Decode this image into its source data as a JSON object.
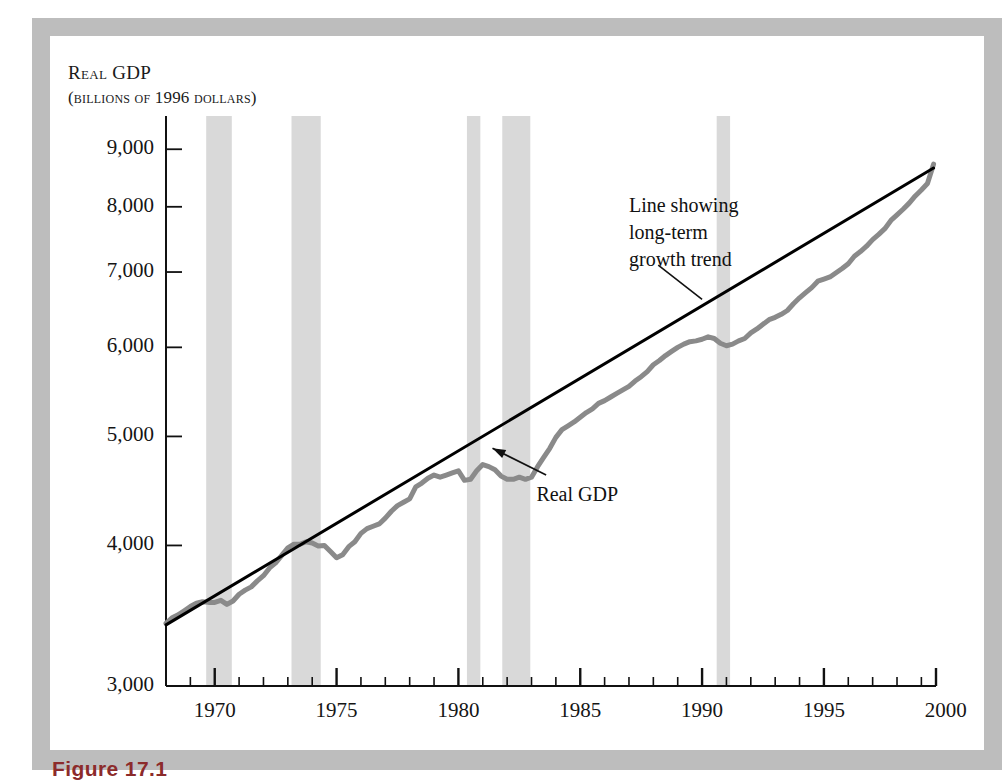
{
  "figure": {
    "caption": "Figure 17.1",
    "frame_color": "#bdbdbd",
    "background": "#ffffff"
  },
  "chart_data": {
    "type": "line",
    "title": "",
    "ylabel": "Real GDP",
    "ylabel_sub": "(billions of 1996 dollars)",
    "xlabel": "",
    "xlim": [
      1968.0,
      1999.6
    ],
    "ylim": [
      3000,
      9400
    ],
    "grid": false,
    "legend": "none",
    "y_ticks": [
      3000,
      4000,
      5000,
      6000,
      7000,
      8000,
      9000
    ],
    "y_tick_labels": [
      "3,000",
      "4,000",
      "5,000",
      "6,000",
      "7,000",
      "8,000",
      "9,000"
    ],
    "y_scale": "logarithmic",
    "x_ticks": [
      1970,
      1975,
      1980,
      1985,
      1990,
      1995,
      2000
    ],
    "x_tick_labels": [
      "1970",
      "1975",
      "1980",
      "1985",
      "1990",
      "1995",
      "2000"
    ],
    "x_minor_tick_interval": 1,
    "series": [
      {
        "name": "Real GDP",
        "color": "#8a8a8a",
        "linewidth": 5,
        "x": [
          1968.0,
          1968.25,
          1968.5,
          1968.75,
          1969.0,
          1969.25,
          1969.5,
          1969.75,
          1970.0,
          1970.25,
          1970.5,
          1970.75,
          1971.0,
          1971.25,
          1971.5,
          1971.75,
          1972.0,
          1972.25,
          1972.5,
          1972.75,
          1973.0,
          1973.25,
          1973.5,
          1973.75,
          1974.0,
          1974.25,
          1974.5,
          1974.75,
          1975.0,
          1975.25,
          1975.5,
          1975.75,
          1976.0,
          1976.25,
          1976.5,
          1976.75,
          1977.0,
          1977.25,
          1977.5,
          1977.75,
          1978.0,
          1978.25,
          1978.5,
          1978.75,
          1979.0,
          1979.25,
          1979.5,
          1979.75,
          1980.0,
          1980.25,
          1980.5,
          1980.75,
          1981.0,
          1981.25,
          1981.5,
          1981.75,
          1982.0,
          1982.25,
          1982.5,
          1982.75,
          1983.0,
          1983.25,
          1983.5,
          1983.75,
          1984.0,
          1984.25,
          1984.5,
          1984.75,
          1985.0,
          1985.25,
          1985.5,
          1985.75,
          1986.0,
          1986.25,
          1986.5,
          1986.75,
          1987.0,
          1987.25,
          1987.5,
          1987.75,
          1988.0,
          1988.25,
          1988.5,
          1988.75,
          1989.0,
          1989.25,
          1989.5,
          1989.75,
          1990.0,
          1990.25,
          1990.5,
          1990.75,
          1991.0,
          1991.25,
          1991.5,
          1991.75,
          1992.0,
          1992.25,
          1992.5,
          1992.75,
          1993.0,
          1993.25,
          1993.5,
          1993.75,
          1994.0,
          1994.25,
          1994.5,
          1994.75,
          1995.0,
          1995.25,
          1995.5,
          1995.75,
          1996.0,
          1996.25,
          1996.5,
          1996.75,
          1997.0,
          1997.25,
          1997.5,
          1997.75,
          1998.0,
          1998.25,
          1998.5,
          1998.75,
          1999.0,
          1999.25,
          1999.5
        ],
        "y": [
          3410,
          3450,
          3470,
          3500,
          3530,
          3555,
          3565,
          3560,
          3560,
          3575,
          3545,
          3570,
          3620,
          3650,
          3675,
          3720,
          3760,
          3820,
          3860,
          3920,
          3980,
          4010,
          4010,
          4030,
          4020,
          3995,
          4000,
          3950,
          3900,
          3925,
          3990,
          4030,
          4100,
          4140,
          4160,
          4180,
          4230,
          4290,
          4340,
          4370,
          4400,
          4510,
          4545,
          4590,
          4620,
          4600,
          4620,
          4640,
          4660,
          4570,
          4580,
          4660,
          4720,
          4700,
          4670,
          4610,
          4580,
          4580,
          4600,
          4580,
          4600,
          4700,
          4790,
          4880,
          4990,
          5070,
          5110,
          5150,
          5200,
          5250,
          5290,
          5350,
          5380,
          5420,
          5460,
          5500,
          5540,
          5600,
          5650,
          5710,
          5790,
          5840,
          5900,
          5950,
          6000,
          6040,
          6070,
          6080,
          6100,
          6130,
          6110,
          6050,
          6020,
          6040,
          6080,
          6110,
          6180,
          6230,
          6290,
          6350,
          6380,
          6420,
          6470,
          6560,
          6640,
          6710,
          6780,
          6870,
          6900,
          6930,
          6990,
          7050,
          7120,
          7230,
          7300,
          7380,
          7480,
          7560,
          7650,
          7780,
          7870,
          7960,
          8060,
          8180,
          8280,
          8390,
          8730
        ]
      },
      {
        "name": "Line showing long-term growth trend",
        "color": "#000000",
        "linewidth": 3,
        "x": [
          1968.0,
          1999.5
        ],
        "y": [
          3400,
          8660
        ]
      }
    ],
    "recession_bands": {
      "color": "#d9d9d9",
      "spans": [
        [
          1969.65,
          1970.7
        ],
        [
          1973.15,
          1974.35
        ],
        [
          1980.35,
          1980.9
        ],
        [
          1981.8,
          1982.95
        ],
        [
          1990.6,
          1991.15
        ]
      ]
    },
    "annotations": [
      {
        "name": "trend-annotation",
        "lines": [
          "Line showing",
          "long-term",
          "growth trend"
        ],
        "x": 1987.0,
        "y": 8250
      },
      {
        "name": "real-gdp-annotation",
        "lines": [
          "Real GDP"
        ],
        "x": 1983.2,
        "y": 4560
      }
    ]
  }
}
